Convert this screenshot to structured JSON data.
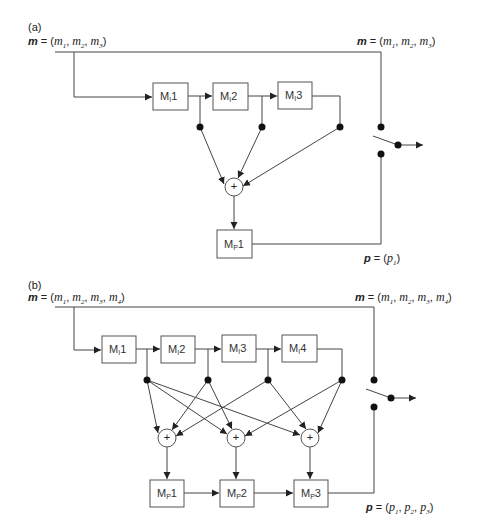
{
  "panel_a": {
    "label": "(a)",
    "input_label": {
      "bold": "m",
      "eq": " = (",
      "vars": [
        "m",
        "m",
        "m"
      ],
      "subs": [
        "1",
        "2",
        "3"
      ]
    },
    "switch_input_label": {
      "bold": "m",
      "eq": " = (",
      "vars": [
        "m",
        "m",
        "m"
      ],
      "subs": [
        "1",
        "2",
        "3"
      ]
    },
    "output_label": {
      "bold": "p",
      "eq": " = (",
      "vars": [
        "p"
      ],
      "subs": [
        "1"
      ]
    },
    "input_blocks": [
      {
        "base": "M",
        "sub": "I",
        "num": "1"
      },
      {
        "base": "M",
        "sub": "I",
        "num": "2"
      },
      {
        "base": "M",
        "sub": "I",
        "num": "3"
      }
    ],
    "sum_nodes": [
      {
        "symbol": "+"
      }
    ],
    "predict_blocks": [
      {
        "base": "M",
        "sub": "P",
        "num": "1"
      }
    ]
  },
  "panel_b": {
    "label": "(b)",
    "input_label": {
      "bold": "m",
      "eq": " = (",
      "vars": [
        "m",
        "m",
        "m",
        "m"
      ],
      "subs": [
        "1",
        "2",
        "3",
        "4"
      ]
    },
    "switch_input_label": {
      "bold": "m",
      "eq": " = (",
      "vars": [
        "m",
        "m",
        "m",
        "m"
      ],
      "subs": [
        "1",
        "2",
        "3",
        "4"
      ]
    },
    "output_label": {
      "bold": "p",
      "eq": " = (",
      "vars": [
        "p",
        "p",
        "p"
      ],
      "subs": [
        "1",
        "2",
        "3"
      ]
    },
    "input_blocks": [
      {
        "base": "M",
        "sub": "I",
        "num": "1"
      },
      {
        "base": "M",
        "sub": "I",
        "num": "2"
      },
      {
        "base": "M",
        "sub": "I",
        "num": "3"
      },
      {
        "base": "M",
        "sub": "I",
        "num": "4"
      }
    ],
    "sum_nodes": [
      {
        "symbol": "+"
      },
      {
        "symbol": "+"
      },
      {
        "symbol": "+"
      }
    ],
    "predict_blocks": [
      {
        "base": "M",
        "sub": "P",
        "num": "1"
      },
      {
        "base": "M",
        "sub": "P",
        "num": "2"
      },
      {
        "base": "M",
        "sub": "P",
        "num": "3"
      }
    ]
  },
  "colors": {
    "line": "#444444",
    "dot": "#111111",
    "box_border": "#555555",
    "text": "#222222"
  }
}
